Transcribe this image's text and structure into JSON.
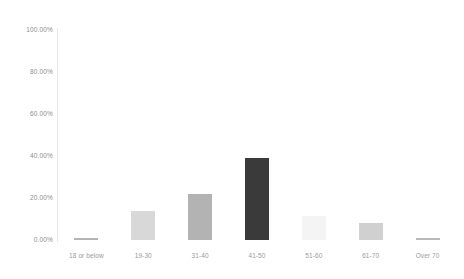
{
  "chart_data": {
    "type": "bar",
    "title": "",
    "subtitle": "",
    "xlabel": "",
    "ylabel": "",
    "categories": [
      "18 or below",
      "19-30",
      "31-40",
      "41-50",
      "51-60",
      "61-70",
      "Over 70"
    ],
    "values": [
      1.0,
      14.0,
      22.0,
      39.0,
      11.5,
      8.0,
      1.0
    ],
    "value_labels": [
      "1.00%",
      "14.00%",
      "22.00%",
      "39.00%",
      "11.50%",
      "8.00%",
      "1.00%"
    ],
    "ylim": [
      0,
      100
    ],
    "ytick_labels": [
      "100.00%",
      "80.00%",
      "60.00%",
      "40.00%",
      "20.00%",
      "0.00%"
    ],
    "ytick_values": [
      100,
      80,
      60,
      40,
      20,
      0
    ],
    "grid": false,
    "legend": false,
    "legend_position": "none",
    "bar_colors": [
      "#b4b4b4",
      "#d8d8d8",
      "#b3b3b3",
      "#3a3a3a",
      "#f4f4f4",
      "#d0d0d0",
      "#b9b9b9"
    ],
    "axis_color": "#e9e9e9",
    "tick_label_color": "#8d8d8d",
    "background_color": "#ffffff"
  },
  "axes": {
    "y_ticks": [
      {
        "label": "100.00%",
        "value": 100
      },
      {
        "label": "80.00%",
        "value": 80
      },
      {
        "label": "60.00%",
        "value": 60
      },
      {
        "label": "40.00%",
        "value": 40
      },
      {
        "label": "20.00%",
        "value": 20
      },
      {
        "label": "0.00%",
        "value": 0
      }
    ],
    "x_ticks": [
      {
        "label": "18 or below"
      },
      {
        "label": "19-30"
      },
      {
        "label": "31-40"
      },
      {
        "label": "41-50"
      },
      {
        "label": "51-60"
      },
      {
        "label": "61-70"
      },
      {
        "label": "Over 70"
      }
    ]
  }
}
